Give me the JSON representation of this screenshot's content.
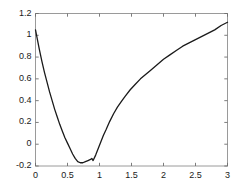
{
  "chart_data": {
    "type": "line",
    "title": "",
    "xlabel": "",
    "ylabel": "",
    "xlim": [
      0,
      3
    ],
    "ylim": [
      -0.2,
      1.2
    ],
    "grid": false,
    "legend": null,
    "box": true,
    "tick_direction": "in",
    "line_color": "#1a1a1a",
    "axes_color": "#9a9a9a",
    "background": "#ffffff",
    "xticks": [
      0,
      0.5,
      1,
      1.5,
      2,
      2.5,
      3
    ],
    "xtick_labels": [
      "0",
      "0.5",
      "1",
      "1.5",
      "2",
      "2.5",
      "3"
    ],
    "yticks": [
      -0.2,
      0,
      0.2,
      0.4,
      0.6,
      0.8,
      1,
      1.2
    ],
    "ytick_labels": [
      "-0.2",
      "0",
      "0.2",
      "0.4",
      "0.6",
      "0.8",
      "1",
      "1.2"
    ],
    "series": [
      {
        "name": "curve",
        "color": "#1a1a1a",
        "width": 1.3,
        "x": [
          0.0,
          0.03,
          0.06,
          0.1,
          0.14,
          0.18,
          0.22,
          0.26,
          0.3,
          0.34,
          0.38,
          0.42,
          0.46,
          0.5,
          0.54,
          0.58,
          0.62,
          0.66,
          0.7,
          0.74,
          0.78,
          0.82,
          0.86,
          0.88,
          0.9,
          0.94,
          0.98,
          1.02,
          1.06,
          1.1,
          1.16,
          1.22,
          1.28,
          1.34,
          1.4,
          1.48,
          1.56,
          1.64,
          1.72,
          1.8,
          1.9,
          2.0,
          2.1,
          2.2,
          2.3,
          2.4,
          2.5,
          2.6,
          2.7,
          2.8,
          2.9,
          3.0
        ],
        "y": [
          1.05,
          0.96,
          0.87,
          0.76,
          0.66,
          0.57,
          0.48,
          0.4,
          0.32,
          0.25,
          0.18,
          0.12,
          0.06,
          0.01,
          -0.04,
          -0.09,
          -0.13,
          -0.16,
          -0.17,
          -0.17,
          -0.16,
          -0.15,
          -0.14,
          -0.13,
          -0.15,
          -0.1,
          -0.04,
          0.02,
          0.08,
          0.13,
          0.21,
          0.28,
          0.34,
          0.39,
          0.44,
          0.5,
          0.55,
          0.6,
          0.64,
          0.68,
          0.73,
          0.78,
          0.82,
          0.86,
          0.9,
          0.93,
          0.96,
          0.99,
          1.02,
          1.05,
          1.09,
          1.12
        ]
      }
    ]
  }
}
